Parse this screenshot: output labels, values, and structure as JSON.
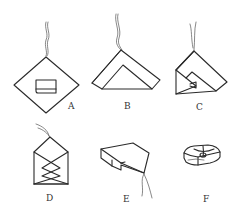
{
  "figure": {
    "panels": [
      {
        "id": "A",
        "label": "A",
        "description": "diamond-shaped sheet with small folded packet in center, string at top"
      },
      {
        "id": "B",
        "label": "B",
        "description": "bottom corner folded up forming a triangle with inner fold"
      },
      {
        "id": "C",
        "label": "C",
        "description": "left side folded over toward center"
      },
      {
        "id": "D",
        "label": "D",
        "description": "envelope shape with crossing folds"
      },
      {
        "id": "E",
        "label": "E",
        "description": "folded packet tilted, string trailing from bottom"
      },
      {
        "id": "F",
        "label": "F",
        "description": "finished tied rounded packet"
      }
    ]
  }
}
